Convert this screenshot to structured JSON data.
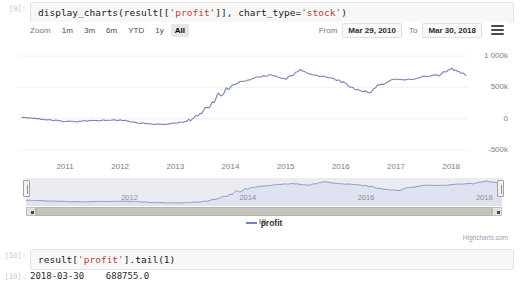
{
  "notebook": {
    "cells": [
      {
        "prompt": "[9]:",
        "code_prefix": "display_charts(result[[",
        "code_str1": "'profit'",
        "code_mid": "]], chart_type=",
        "code_str2": "'stock'",
        "code_suffix": ")"
      },
      {
        "prompt": "[10]:",
        "code_prefix": "result[",
        "code_str1": "'profit'",
        "code_mid": "].tail(1)",
        "code_str2": "",
        "code_suffix": ""
      }
    ],
    "output": {
      "prompt": "[10]:",
      "text": "2018-03-30    688755.0"
    }
  },
  "chart": {
    "range_selector": {
      "zoom_label": "Zoom",
      "buttons": [
        {
          "label": "1m",
          "selected": false
        },
        {
          "label": "3m",
          "selected": false
        },
        {
          "label": "6m",
          "selected": false
        },
        {
          "label": "YTD",
          "selected": false
        },
        {
          "label": "1y",
          "selected": false
        },
        {
          "label": "All",
          "selected": true
        }
      ],
      "from_label": "From",
      "from_value": "Mar 29, 2010",
      "to_label": "To",
      "to_value": "Mar 30, 2018",
      "menu_icon": "hamburger-menu-icon"
    },
    "legend": {
      "series_name": "profit"
    },
    "credits": "Highcharts.com",
    "series_color": "#7384b5",
    "navigator_fill": "#ebebf2",
    "navigator_line_color": "#7384b5"
  },
  "chart_data": {
    "type": "line",
    "title": "",
    "subtitle": "",
    "xlabel": "",
    "ylabel": "",
    "grid": true,
    "legend_position": "bottom",
    "series": [
      {
        "name": "profit",
        "color": "#7384b5",
        "x": [
          "2010-03-29",
          "2010-06-30",
          "2010-09-30",
          "2010-12-31",
          "2011-03-31",
          "2011-06-30",
          "2011-09-30",
          "2011-12-31",
          "2012-03-31",
          "2012-06-30",
          "2012-09-30",
          "2012-12-31",
          "2013-03-31",
          "2013-06-30",
          "2013-09-30",
          "2013-12-31",
          "2014-03-31",
          "2014-06-30",
          "2014-09-30",
          "2014-12-31",
          "2015-03-31",
          "2015-06-30",
          "2015-09-30",
          "2015-12-31",
          "2016-03-31",
          "2016-06-30",
          "2016-09-30",
          "2016-12-31",
          "2017-03-31",
          "2017-06-30",
          "2017-09-30",
          "2017-12-31",
          "2018-03-30"
        ],
        "values": [
          20000,
          5000,
          -20000,
          -40000,
          -45000,
          -30000,
          -25000,
          -20000,
          -60000,
          -75000,
          -95000,
          -70000,
          -35000,
          120000,
          330000,
          520000,
          600000,
          660000,
          700000,
          640000,
          780000,
          700000,
          660000,
          600000,
          470000,
          420000,
          560000,
          630000,
          620000,
          670000,
          700000,
          800000,
          688755
        ]
      }
    ],
    "yaxis": {
      "ticks": [
        "1 000k",
        "500k",
        "0",
        "-500k"
      ],
      "tick_values": [
        1000000,
        500000,
        0,
        -500000
      ],
      "min": -500000,
      "max": 1000000,
      "opposite": true
    },
    "xaxis": {
      "ticks": [
        "2011",
        "2012",
        "2013",
        "2014",
        "2015",
        "2016",
        "2017",
        "2018"
      ],
      "min": "2010-03-29",
      "max": "2018-03-30"
    },
    "navigator_xaxis": {
      "ticks": [
        "2012",
        "2014",
        "2016",
        "2018"
      ]
    }
  }
}
